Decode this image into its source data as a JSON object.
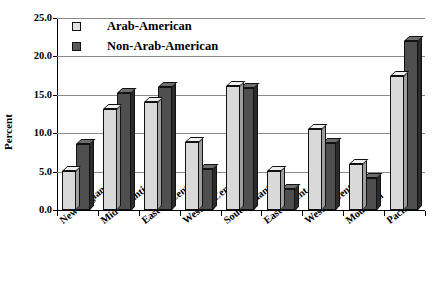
{
  "chart_data": {
    "type": "bar",
    "title": "",
    "xlabel": "",
    "ylabel": "Percent",
    "ylim": [
      0,
      25
    ],
    "ytick_labels": [
      "0.0",
      "5.0",
      "10.0",
      "15.0",
      "20.0",
      "25.0"
    ],
    "ytick_values": [
      0,
      5,
      10,
      15,
      20,
      25
    ],
    "grid": true,
    "legend_position": "top-left",
    "categories": [
      "New England",
      "Mid-Atlantic",
      "East N. Cent.",
      "West N. Cent.",
      "South Atlantic",
      "East S.Cent.",
      "West S. Cent.",
      "Mountain",
      "Pacific"
    ],
    "series": [
      {
        "name": "Arab-American",
        "color": "#d9d9d9",
        "values": [
          5.1,
          13.2,
          14.1,
          8.9,
          16.1,
          5.1,
          10.6,
          6.0,
          17.5
        ]
      },
      {
        "name": "Non-Arab-American",
        "color": "#4f4f4f",
        "values": [
          8.6,
          15.3,
          16.0,
          5.3,
          15.9,
          2.8,
          8.7,
          4.2,
          22.0
        ]
      }
    ]
  },
  "legend": {
    "items": [
      {
        "label": "Arab-American",
        "swatch": "light"
      },
      {
        "label": "Non-Arab-American",
        "swatch": "dark"
      }
    ]
  },
  "axes": {
    "y_title": "Percent"
  }
}
